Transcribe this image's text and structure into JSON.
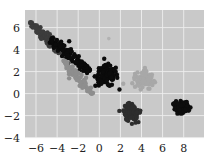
{
  "chart_data": {
    "type": "scatter",
    "title": "",
    "xlabel": "",
    "ylabel": "",
    "xlim": [
      -7,
      9.8
    ],
    "ylim": [
      -4.1,
      7.2
    ],
    "grid": true,
    "legend": null,
    "x_ticks": [
      -6,
      -4,
      -2,
      0,
      2,
      4,
      6,
      8
    ],
    "y_ticks": [
      -4,
      -2,
      0,
      2,
      4,
      6
    ],
    "x_tick_labels": [
      "−6",
      "−4",
      "−2",
      "0",
      "2",
      "4",
      "6",
      "8"
    ],
    "y_tick_labels": [
      "−4",
      "−2",
      "0",
      "2",
      "4",
      "6"
    ],
    "background": "#c9c9c9",
    "grid_color": "#eeeeee",
    "series": [
      {
        "name": "cluster-1",
        "color": "#3c3c3c",
        "shape": "elongated band",
        "from": [
          -6.6,
          6.5
        ],
        "to": [
          -3.0,
          3.3
        ],
        "width": 0.5,
        "n": 120
      },
      {
        "name": "cluster-2",
        "color": "#0b0b0b",
        "shape": "elongated band",
        "from": [
          -4.6,
          4.9
        ],
        "to": [
          -0.8,
          2.0
        ],
        "width": 0.6,
        "n": 120
      },
      {
        "name": "cluster-2b",
        "color": "#0b0b0b",
        "shape": "blob",
        "center": [
          0.7,
          1.6
        ],
        "spread": [
          0.9,
          0.8
        ],
        "n": 110
      },
      {
        "name": "cluster-3",
        "color": "#8e8e8e",
        "shape": "elongated band",
        "from": [
          -3.4,
          3.0
        ],
        "to": [
          -0.7,
          0.0
        ],
        "width": 0.45,
        "n": 90
      },
      {
        "name": "cluster-4",
        "color": "#a8a8a8",
        "shape": "blob",
        "center": [
          4.2,
          1.2
        ],
        "spread": [
          0.8,
          0.6
        ],
        "n": 90
      },
      {
        "name": "cluster-5",
        "color": "#2d2d2d",
        "shape": "blob",
        "center": [
          3.1,
          -1.7
        ],
        "spread": [
          0.7,
          0.6
        ],
        "n": 110
      },
      {
        "name": "cluster-6",
        "color": "#0d0d0d",
        "shape": "blob",
        "center": [
          7.8,
          -1.3
        ],
        "spread": [
          0.6,
          0.45
        ],
        "n": 110
      }
    ],
    "outliers": [
      {
        "x": 0.9,
        "y": 5.0,
        "color": "#b2b2b2"
      }
    ]
  }
}
